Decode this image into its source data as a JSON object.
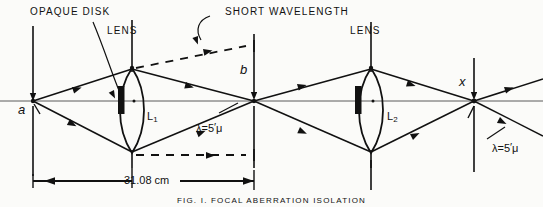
{
  "figure": {
    "annotations": {
      "opaque_disk": "OPAQUE DISK",
      "lens_left": "LENS",
      "lens_right": "LENS",
      "short_wavelength": "SHORT WAVELENGTH"
    },
    "points": {
      "source": "a",
      "intermediate_image": "b",
      "final_image": "x"
    },
    "lenses": {
      "first": {
        "label": "L",
        "subscript": "1"
      },
      "second": {
        "label": "L",
        "subscript": "2"
      }
    },
    "wavelength_labels": {
      "left": {
        "prefix": "λ=5",
        "stroke": "′",
        "unit": "μ"
      },
      "right": {
        "prefix": "λ=5",
        "stroke": "′",
        "unit": "μ"
      }
    },
    "dimension": {
      "value": "31.08",
      "unit": "cm",
      "text": "31.08 cm"
    },
    "caption": "FIG. I.  FOCAL ABERRATION ISOLATION",
    "colors": {
      "ink": "#111111",
      "paper": "#fbfbf9",
      "axis": "#4a4a4a"
    }
  }
}
